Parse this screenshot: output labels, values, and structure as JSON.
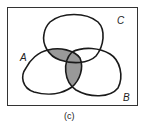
{
  "diagram": {
    "type": "venn",
    "sets": [
      "A",
      "B",
      "C"
    ],
    "labels": {
      "A": "A",
      "B": "B",
      "C": "C"
    },
    "caption": "(c)",
    "shaded_regions": [
      "A∩C",
      "A∩B"
    ],
    "colors": {
      "outline": "#1a1a1a",
      "shade": "#999999",
      "frame": "#333333",
      "background": "#ffffff"
    }
  }
}
